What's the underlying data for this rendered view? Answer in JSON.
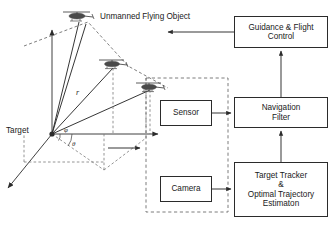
{
  "diagram": {
    "scene_label_ufo": "Unmanned\nFlying\nObject",
    "scene_label_ufo_lines": [
      "Unmanned",
      "Flying",
      "Object"
    ],
    "target_label": "Target",
    "range_symbol": "r",
    "azimuth_symbol": "φ",
    "elevation_symbol": "θ",
    "colors": {
      "stroke": "#2b2b2b",
      "dashed": "#6e6e6e",
      "box_fill": "#ffffff",
      "text": "#1a1a1a",
      "vehicle": "#4a4a4a"
    }
  },
  "boxes": {
    "guidance": {
      "lines": [
        "Guidance & Flight",
        "Control"
      ]
    },
    "navigation_filter": {
      "lines": [
        "Navigation",
        "Filter"
      ]
    },
    "tracker": {
      "lines": [
        "Target Tracker",
        "&",
        "Optimal Trajectory",
        "Estimaton"
      ]
    },
    "sensor": {
      "lines": [
        "Sensor"
      ]
    },
    "camera": {
      "lines": [
        "Camera"
      ]
    }
  },
  "vehicles": [
    {
      "name": "helicopter-top",
      "x": 77,
      "y": 14
    },
    {
      "name": "helicopter-middle",
      "x": 112,
      "y": 62
    },
    {
      "name": "helicopter-lower",
      "x": 149,
      "y": 85
    }
  ],
  "connections": [
    {
      "from": "sensor",
      "to": "navigation_filter",
      "style": "solid-arrow"
    },
    {
      "from": "camera",
      "to": "tracker",
      "style": "solid-arrow"
    },
    {
      "from": "tracker",
      "to": "navigation_filter",
      "style": "solid-arrow"
    },
    {
      "from": "navigation_filter",
      "to": "guidance",
      "style": "solid-arrow"
    },
    {
      "from": "guidance",
      "to": "unmanned_flying_object",
      "style": "solid-arrow"
    },
    {
      "from": "scene",
      "to": "onboard_payload_group",
      "style": "solid-arrow"
    }
  ]
}
